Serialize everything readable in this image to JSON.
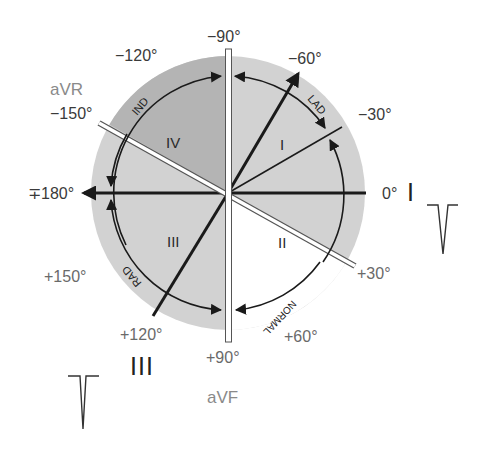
{
  "diagram": {
    "center": {
      "x": 228,
      "y": 193
    },
    "radius_outer": 137,
    "radius_arc": 117,
    "colors": {
      "disc": "#d2d2d2",
      "quadrant_iv": "#b4b4b4",
      "normal_sector": "#ffffff",
      "lines": "#1a1a1a",
      "lead_bar_fill": "#ffffff",
      "lead_bar_stroke": "#555555"
    },
    "angle_labels": {
      "m90": "−90°",
      "m120": "−120°",
      "m60": "−60°",
      "m150": "−150°",
      "m30": "−30°",
      "pm180": "∓180°",
      "zero": "0°",
      "p150": "+150°",
      "p30": "+30°",
      "p120": "+120°",
      "p60": "+60°",
      "p90": "+90°"
    },
    "leads": {
      "avr": "aVR",
      "avf": "aVF",
      "lead_i": "I",
      "lead_iii": "III"
    },
    "quadrants": {
      "q1": "I",
      "q2": "II",
      "q3": "III",
      "q4": "IV"
    },
    "arc_labels": {
      "lad": "LAD",
      "ind": "IND",
      "rad": "RAD",
      "normal": "NORMAL"
    },
    "waveforms": [
      {
        "lead": "I",
        "shape": "negative-deflection"
      },
      {
        "lead": "III",
        "shape": "negative-deflection"
      }
    ]
  }
}
